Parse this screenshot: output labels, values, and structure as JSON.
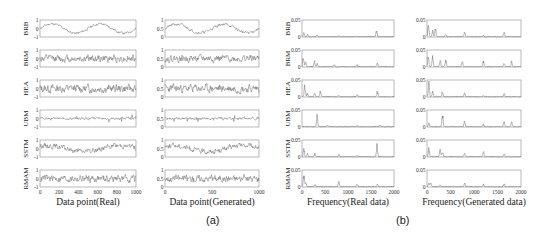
{
  "chart_data": [
    {
      "id": "a-real",
      "type": "line",
      "group": "(a)",
      "xlabel": "Data point(Real)",
      "xlim": [
        0,
        1000
      ],
      "xticks": [
        "0",
        "200",
        "400",
        "600",
        "800",
        "1000"
      ],
      "xtick_values": [
        0,
        200,
        400,
        600,
        800,
        1000
      ],
      "ylim": [
        -1,
        1
      ],
      "yticks": [
        "-1",
        "0",
        "1"
      ],
      "ytick_values": [
        -1,
        0,
        1
      ],
      "rows": [
        {
          "label": "BRB",
          "pattern": "sine",
          "periods": 2,
          "amplitude": 0.55,
          "noise": 0.12,
          "seed": 11
        },
        {
          "label": "BRM",
          "pattern": "noise",
          "amplitude": 0.0,
          "noise": 0.35,
          "seed": 12
        },
        {
          "label": "HEA",
          "pattern": "noise",
          "amplitude": 0.0,
          "noise": 0.4,
          "seed": 13
        },
        {
          "label": "UBM",
          "pattern": "spiky",
          "amplitude": 0.0,
          "noise": 0.12,
          "seed": 14
        },
        {
          "label": "SSTM",
          "pattern": "slow",
          "amplitude": 0.35,
          "noise": 0.25,
          "seed": 15
        },
        {
          "label": "RMAM",
          "pattern": "noise",
          "amplitude": 0.0,
          "noise": 0.35,
          "seed": 16
        }
      ]
    },
    {
      "id": "a-generated",
      "type": "line",
      "group": "(a)",
      "xlabel": "Data point(Generated)",
      "xlim": [
        0,
        1000
      ],
      "xticks": [
        "0",
        "500",
        "1000"
      ],
      "xtick_values": [
        0,
        500,
        1000
      ],
      "ylim": [
        0,
        1
      ],
      "yticks": [
        "0",
        "0.5",
        "1"
      ],
      "ytick_values": [
        0,
        0.5,
        1
      ],
      "rows": [
        {
          "label": "BRB",
          "pattern": "sine",
          "periods": 2,
          "amplitude": 0.25,
          "noise": 0.07,
          "seed": 21
        },
        {
          "label": "BRM",
          "pattern": "noise",
          "amplitude": 0.0,
          "noise": 0.17,
          "seed": 22
        },
        {
          "label": "HEA",
          "pattern": "noise",
          "amplitude": 0.0,
          "noise": 0.2,
          "seed": 23
        },
        {
          "label": "UBM",
          "pattern": "spiky",
          "amplitude": 0.0,
          "noise": 0.06,
          "seed": 24
        },
        {
          "label": "SSTM",
          "pattern": "slow",
          "amplitude": 0.18,
          "noise": 0.12,
          "seed": 25
        },
        {
          "label": "RMAM",
          "pattern": "noise",
          "amplitude": 0.0,
          "noise": 0.17,
          "seed": 26
        }
      ]
    },
    {
      "id": "b-real",
      "type": "line",
      "group": "(b)",
      "xlabel": "Frequency(Real data)",
      "xlim": [
        0,
        2000
      ],
      "xticks": [
        "0",
        "500",
        "1000",
        "1500",
        "2000"
      ],
      "xtick_values": [
        0,
        500,
        1000,
        1500,
        2000
      ],
      "ylim": [
        0,
        0.05
      ],
      "yticks": [
        "0",
        "0.05"
      ],
      "ytick_values": [
        0,
        0.05
      ],
      "rows": [
        {
          "label": "BRB",
          "peaks": [
            [
              40,
              0.015
            ],
            [
              120,
              0.008
            ],
            [
              330,
              0.006
            ],
            [
              800,
              0.004
            ],
            [
              1200,
              0.004
            ],
            [
              1620,
              0.02
            ]
          ],
          "seed": 31
        },
        {
          "label": "BRM",
          "peaks": [
            [
              30,
              0.035
            ],
            [
              80,
              0.02
            ],
            [
              270,
              0.02
            ],
            [
              330,
              0.012
            ],
            [
              700,
              0.008
            ],
            [
              1200,
              0.008
            ],
            [
              1640,
              0.012
            ]
          ],
          "seed": 32
        },
        {
          "label": "HEA",
          "peaks": [
            [
              60,
              0.045
            ],
            [
              120,
              0.012
            ],
            [
              280,
              0.015
            ],
            [
              400,
              0.02
            ],
            [
              800,
              0.004
            ],
            [
              1200,
              0.008
            ],
            [
              1640,
              0.02
            ]
          ],
          "seed": 33
        },
        {
          "label": "UBM",
          "peaks": [
            [
              330,
              0.04
            ],
            [
              550,
              0.005
            ],
            [
              1200,
              0.004
            ],
            [
              1700,
              0.007
            ]
          ],
          "seed": 34
        },
        {
          "label": "SSTM",
          "peaks": [
            [
              40,
              0.03
            ],
            [
              120,
              0.01
            ],
            [
              280,
              0.012
            ],
            [
              800,
              0.008
            ],
            [
              1200,
              0.004
            ],
            [
              1630,
              0.045
            ]
          ],
          "seed": 35
        },
        {
          "label": "RMAM",
          "peaks": [
            [
              40,
              0.038
            ],
            [
              80,
              0.015
            ],
            [
              280,
              0.01
            ],
            [
              800,
              0.018
            ],
            [
              1200,
              0.01
            ],
            [
              1640,
              0.008
            ]
          ],
          "seed": 36
        }
      ]
    },
    {
      "id": "b-generated",
      "type": "line",
      "group": "(b)",
      "xlabel": "Frequency(Generated data)",
      "xlim": [
        0,
        2000
      ],
      "xticks": [
        "0",
        "500",
        "1000",
        "1500",
        "2000"
      ],
      "xtick_values": [
        0,
        500,
        1000,
        1500,
        2000
      ],
      "ylim": [
        0,
        0.05
      ],
      "yticks": [
        "0",
        "0.05"
      ],
      "ytick_values": [
        0,
        0.05
      ],
      "rows": [
        {
          "label": "BRB",
          "peaks": [
            [
              30,
              0.045
            ],
            [
              120,
              0.02
            ],
            [
              180,
              0.03
            ],
            [
              400,
              0.01
            ],
            [
              800,
              0.015
            ],
            [
              1200,
              0.005
            ],
            [
              1640,
              0.015
            ]
          ],
          "seed": 41
        },
        {
          "label": "BRM",
          "peaks": [
            [
              30,
              0.045
            ],
            [
              120,
              0.035
            ],
            [
              280,
              0.02
            ],
            [
              400,
              0.025
            ],
            [
              750,
              0.02
            ],
            [
              1200,
              0.02
            ],
            [
              1640,
              0.015
            ],
            [
              1800,
              0.018
            ]
          ],
          "seed": 42
        },
        {
          "label": "HEA",
          "peaks": [
            [
              40,
              0.05
            ],
            [
              120,
              0.02
            ],
            [
              330,
              0.02
            ],
            [
              800,
              0.015
            ],
            [
              1200,
              0.005
            ],
            [
              1640,
              0.012
            ]
          ],
          "seed": 43
        },
        {
          "label": "UBM",
          "peaks": [
            [
              40,
              0.015
            ],
            [
              330,
              0.045
            ],
            [
              800,
              0.02
            ],
            [
              1200,
              0.008
            ],
            [
              1640,
              0.02
            ],
            [
              1800,
              0.015
            ]
          ],
          "seed": 44
        },
        {
          "label": "SSTM",
          "peaks": [
            [
              40,
              0.03
            ],
            [
              280,
              0.025
            ],
            [
              330,
              0.02
            ],
            [
              800,
              0.015
            ],
            [
              1200,
              0.02
            ],
            [
              1640,
              0.01
            ]
          ],
          "seed": 45
        },
        {
          "label": "RMAM",
          "peaks": [
            [
              40,
              0.015
            ],
            [
              80,
              0.012
            ],
            [
              280,
              0.006
            ],
            [
              800,
              0.015
            ],
            [
              1200,
              0.008
            ],
            [
              1640,
              0.01
            ]
          ],
          "seed": 46
        }
      ]
    }
  ],
  "panel_labels": {
    "a": "(a)",
    "b": "(b)"
  }
}
